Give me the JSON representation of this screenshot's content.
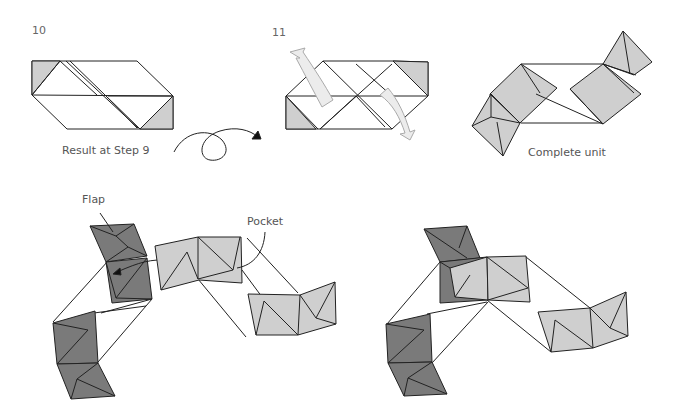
{
  "steps": [
    {
      "number": "10",
      "caption": "Result at Step 9"
    },
    {
      "number": "11",
      "caption": ""
    },
    {
      "number": "",
      "caption": "Complete unit"
    }
  ],
  "annotations": {
    "flap": "Flap",
    "pocket": "Pocket"
  },
  "colors": {
    "light_fill": "#cfcfcf",
    "dark_fill": "#7a7a7a",
    "stroke": "#222222",
    "arrow_fill": "#ececec"
  }
}
